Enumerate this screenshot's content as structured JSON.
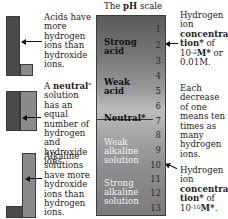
{
  "title": {
    "prefix": "The ",
    "bold": "pH",
    "suffix": " scale"
  },
  "left_notes": {
    "acid": "Acids have more hydrogen ions than hydroxide ions.",
    "neutral_bold": "neutral",
    "neutral_prefix": "A ",
    "neutral_star": "*",
    "neutral_rest": " solution has an equal number of hydrogen and hydroxide ions.",
    "alkaline": "Alkaline solutions have more hydroxide ions than hydrogen ions."
  },
  "scale": {
    "numbers": [
      "1",
      "2",
      "3",
      "4",
      "5",
      "6",
      "7",
      "8",
      "9",
      "10",
      "11",
      "12",
      "13"
    ],
    "labels": {
      "strong_acid_1": "Strong",
      "strong_acid_2": "acid",
      "weak_acid_1": "Weak",
      "weak_acid_2": "acid",
      "neutral": "Neutral*",
      "weak_alk_1": "Weak",
      "weak_alk_2": "alkaline",
      "weak_alk_3": "solution",
      "strong_alk_1": "Strong",
      "strong_alk_2": "alkaline",
      "strong_alk_3": "solution"
    }
  },
  "right_notes": {
    "top_1": "Hydrogen",
    "top_2": "ion",
    "top_bold_1": "concentra-",
    "top_bold_2": "tion*",
    "top_of": " of",
    "top_base": "10",
    "top_exp": "-2",
    "top_unit": "M*",
    "top_or": " or",
    "top_value": "0.01M.",
    "mid": "Each decrease of one means ten times as many hydrogen ions.",
    "bot_1": "Hydrogen",
    "bot_2": "ion",
    "bot_bold_1": "concentra-",
    "bot_bold_2": "tion*",
    "bot_of": " of",
    "bot_base": "10",
    "bot_exp": "-10",
    "bot_unit": "M*",
    "bot_end": "."
  },
  "colors": {
    "dark_bar": "#4a4a4a",
    "light_bar": "#8a8a8a",
    "scale_border": "#3d3d3d"
  }
}
